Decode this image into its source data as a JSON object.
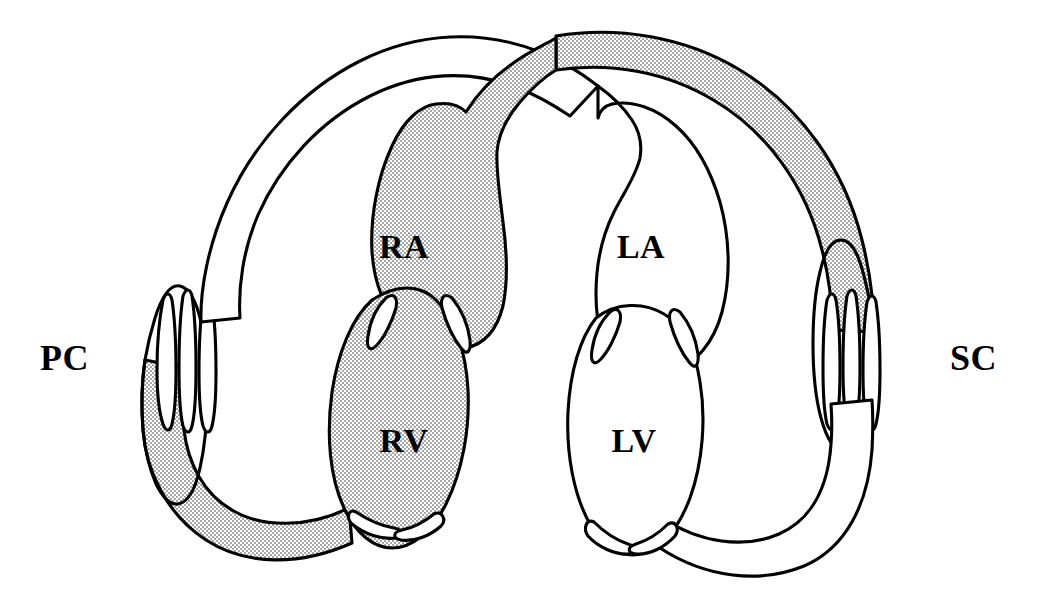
{
  "diagram": {
    "type": "anatomical-schematic",
    "background_color": "#ffffff",
    "stroke_color": "#000000",
    "deoxygenated_fill": "#cfcfcf",
    "oxygenated_fill": "#ffffff"
  },
  "labels": {
    "pulmonary_capillaries": "PC",
    "systemic_capillaries": "SC",
    "right_atrium": "RA",
    "left_atrium": "LA",
    "right_ventricle": "RV",
    "left_ventricle": "LV"
  },
  "label_positions": {
    "pulmonary_capillaries": {
      "x": 40,
      "y": 370
    },
    "systemic_capillaries": {
      "x": 957,
      "y": 370
    },
    "right_atrium": {
      "x": 404,
      "y": 258
    },
    "left_atrium": {
      "x": 641,
      "y": 258
    },
    "right_ventricle": {
      "x": 404,
      "y": 452
    },
    "left_ventricle": {
      "x": 634,
      "y": 452
    }
  },
  "chambers": [
    {
      "code": "RA",
      "name": "Right atrium",
      "blood": "deoxygenated",
      "fill": "#cfcfcf"
    },
    {
      "code": "RV",
      "name": "Right ventricle",
      "blood": "deoxygenated",
      "fill": "#cfcfcf"
    },
    {
      "code": "LA",
      "name": "Left atrium",
      "blood": "oxygenated",
      "fill": "#ffffff"
    },
    {
      "code": "LV",
      "name": "Left ventricle",
      "blood": "oxygenated",
      "fill": "#ffffff"
    }
  ],
  "capillary_beds": [
    {
      "code": "PC",
      "name": "Pulmonary capillaries",
      "side": "left",
      "slit_count": 3,
      "gradient": "deoxygenated-bottom-to-oxygenated-top"
    },
    {
      "code": "SC",
      "name": "Systemic capillaries",
      "side": "right",
      "slit_count": 3,
      "gradient": "oxygenated-bottom-to-deoxygenated-top"
    }
  ],
  "vessels": [
    {
      "name": "Pulmonary artery",
      "from": "RV",
      "to": "PC",
      "blood": "deoxygenated",
      "path": "bottom-left loop"
    },
    {
      "name": "Pulmonary vein",
      "from": "PC",
      "to": "LA",
      "blood": "oxygenated",
      "path": "top-left loop"
    },
    {
      "name": "Aorta",
      "from": "LV",
      "to": "SC",
      "blood": "oxygenated",
      "path": "bottom-right loop"
    },
    {
      "name": "Vena cava",
      "from": "SC",
      "to": "RA",
      "blood": "deoxygenated",
      "path": "top-right loop"
    }
  ],
  "valves": [
    {
      "name": "Right atrioventricular valve",
      "between": [
        "RA",
        "RV"
      ],
      "leaflets": 2
    },
    {
      "name": "Left atrioventricular valve",
      "between": [
        "LA",
        "LV"
      ],
      "leaflets": 2
    },
    {
      "name": "Pulmonary semilunar valve",
      "between": [
        "RV",
        "Pulmonary artery"
      ],
      "leaflets": 2
    },
    {
      "name": "Aortic semilunar valve",
      "between": [
        "LV",
        "Aorta"
      ],
      "leaflets": 2
    }
  ]
}
